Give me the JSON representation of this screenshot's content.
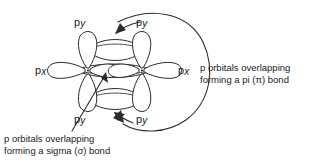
{
  "figure": {
    "background_color": "#ffffff",
    "stroke_color": "#2b2b2b",
    "text_color": "#1a1a1a"
  },
  "orbital_labels": {
    "py_top_left": {
      "base": "p",
      "sub": "y"
    },
    "py_top_right": {
      "base": "p",
      "sub": "y"
    },
    "py_bottom_left": {
      "base": "p",
      "sub": "y"
    },
    "py_bottom_right": {
      "base": "p",
      "sub": "y"
    },
    "px_left": {
      "base": "p",
      "sub": "x"
    },
    "px_right": {
      "base": "p",
      "sub": "x"
    }
  },
  "annotations": {
    "pi_bond": {
      "line1": "p orbitals overlapping",
      "line2": "forming a pi (π) bond"
    },
    "sigma_bond": {
      "line1": "p orbitals overlapping",
      "line2": "forming a sigma (σ) bond"
    }
  },
  "shapes": {
    "atoms": 2,
    "lobes_per_atom": 4,
    "pi_overlap_regions": 2,
    "sigma_overlap_regions": 1,
    "pointer_arrows": 3
  }
}
